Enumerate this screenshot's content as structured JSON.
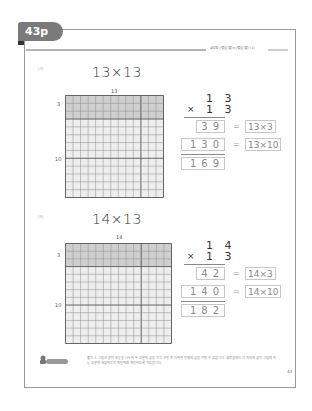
{
  "page": {
    "tab_label": "43p",
    "header_title": "4단원 (몇십 몇)×(몇십 몇) (1)",
    "page_number": "43"
  },
  "problems": [
    {
      "number": "(3)",
      "title": "13×13",
      "grid": {
        "columns": 13,
        "rows": 13,
        "shaded_rows": 3,
        "top_label": "13",
        "side_labels": [
          "3",
          "10"
        ]
      },
      "calc": {
        "multiplicand": "1 3",
        "multiplier_sign": "×",
        "multiplier": "1 3",
        "partial1": "39",
        "partial1_expr": "13×3",
        "partial2": "130",
        "partial2_expr": "13×10",
        "result": "169",
        "equals": "="
      }
    },
    {
      "number": "(4)",
      "title": "14×13",
      "grid": {
        "columns": 14,
        "rows": 13,
        "shaded_rows": 3,
        "top_label": "14",
        "side_labels": [
          "3",
          "10"
        ]
      },
      "calc": {
        "multiplicand": "1 4",
        "multiplier_sign": "×",
        "multiplier": "1 3",
        "partial1": "42",
        "partial1_expr": "14×3",
        "partial2": "140",
        "partial2_expr": "14×10",
        "result": "182",
        "equals": "="
      }
    }
  ],
  "note": {
    "icon": "teacher-note-icon",
    "label": "선생님 도움말",
    "text": "풀이 3. 그림과 같이 모눈을 나누어 두 부분의 곱을 각각 구한 후 더하면 전체의 곱을 구할 수 있습니다. 세로셈에서 각 자리의 곱이 그림의 어느 부분에 해당하는지 확인하며 계산하도록 지도합니다."
  },
  "colors": {
    "shaded": "#cfcfcf",
    "unshaded": "#eeeeee",
    "grid_line": "#8c8c8c",
    "grid_major": "#555555",
    "tab": "#7a7a7a"
  }
}
